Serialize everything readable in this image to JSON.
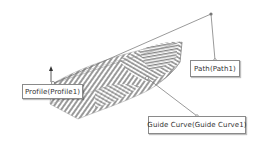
{
  "diagram": {
    "callouts": [
      {
        "id": "profile",
        "label": "Profile(Profile1)"
      },
      {
        "id": "path",
        "label": "Path(Path1)"
      },
      {
        "id": "guide",
        "label": "Guide Curve(Guide Curve1)"
      }
    ],
    "colors": {
      "line": "#6e6e6e",
      "surface_stripe": "#8c8c8c",
      "background": "#ffffff",
      "callout_border": "#8a8a8a",
      "text": "#333333"
    }
  }
}
